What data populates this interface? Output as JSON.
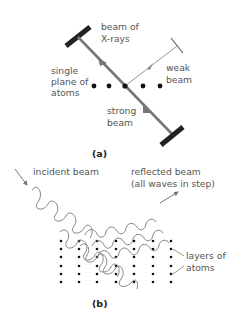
{
  "figure_a": {
    "caption": "(a)",
    "labels": {
      "xray_line1": "beam of",
      "xray_line2": "X-rays",
      "plane_line1": "single",
      "plane_line2": "plane of",
      "plane_line3": "atoms",
      "weak_line1": "weak",
      "weak_line2": "beam",
      "strong_line1": "strong",
      "strong_line2": "beam"
    },
    "atom_count": 5
  },
  "figure_b": {
    "caption": "(b)",
    "labels": {
      "incident": "incident beam",
      "reflected_line1": "reflected beam",
      "reflected_line2": "(all waves in step)",
      "layers_line1": "layers of",
      "layers_line2": "atoms"
    },
    "grid": {
      "columns": 7,
      "rows": 6
    }
  },
  "colors": {
    "beam": "#777777",
    "ink": "#222222",
    "text": "#555555",
    "wave": "#777777"
  }
}
